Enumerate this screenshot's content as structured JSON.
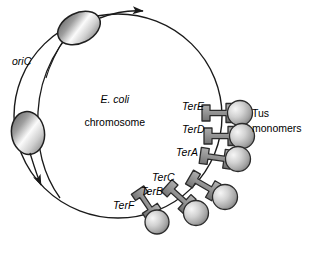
{
  "figure": {
    "title_hidden": "E. coli chromosome with Ter sites bound by Tus monomers",
    "background_color": "#ffffff",
    "line_color": "#1a1a1a",
    "width": 309,
    "height": 254
  },
  "labels": {
    "oric": "oriC",
    "chromosome_line1": "E. coli",
    "chromosome_line2": "chromosome",
    "tus_line1": "Tus",
    "tus_line2": "monomers"
  },
  "chromosome": {
    "shape": "circle",
    "center_x": 118,
    "center_y": 116,
    "radius_x": 104,
    "radius_y": 102,
    "stroke_width": 1.4
  },
  "replication_forks": [
    {
      "name": "upper-fork",
      "cx": 79,
      "cy": 28,
      "rx": 22,
      "ry": 15,
      "rotation": -24,
      "arrow_direction": "clockwise",
      "arrow_label": ""
    },
    {
      "name": "lower-fork",
      "cx": 28,
      "cy": 133,
      "rx": 16,
      "ry": 21,
      "rotation": -8,
      "arrow_direction": "counterclockwise",
      "arrow_label": ""
    }
  ],
  "ter_sites": [
    {
      "id": "terE",
      "label": "TerE",
      "label_x": 182,
      "label_y": 101,
      "tus_cx": 238,
      "tus_cy": 113,
      "bar_angle": 0,
      "order": 1
    },
    {
      "id": "terD",
      "label": "TerD",
      "label_x": 182,
      "label_y": 124,
      "tus_cx": 240,
      "tus_cy": 136,
      "bar_angle": 0,
      "order": 2
    },
    {
      "id": "terA",
      "label": "TerA",
      "label_x": 176,
      "label_y": 147,
      "tus_cx": 236,
      "tus_cy": 159,
      "bar_angle": 0,
      "order": 3
    },
    {
      "id": "terC",
      "label": "TerC",
      "label_x": 152,
      "label_y": 176,
      "tus_cx": 224,
      "tus_cy": 190,
      "bar_angle": 28,
      "order": 4
    },
    {
      "id": "terB",
      "label": "TerB",
      "label_x": 141,
      "label_y": 190,
      "tus_cx": 199,
      "tus_cy": 205,
      "bar_angle": 40,
      "order": 5
    },
    {
      "id": "terF",
      "label": "TerF",
      "label_x": 113,
      "label_y": 204,
      "tus_cx": 160,
      "tus_cy": 215,
      "bar_angle": 58,
      "order": 6
    }
  ],
  "colors": {
    "tus_sphere_light": "#f2f2f2",
    "tus_sphere_mid": "#bdbdbd",
    "tus_sphere_dark": "#8a8a8a",
    "ter_bar_fill": "#8f8f8f",
    "ter_bar_stroke": "#2b2b2b",
    "fork_light": "#fdfdfd",
    "fork_mid": "#a8a8a8",
    "fork_dark": "#4a4a4a",
    "outline": "#1a1a1a",
    "text": "#000000"
  }
}
